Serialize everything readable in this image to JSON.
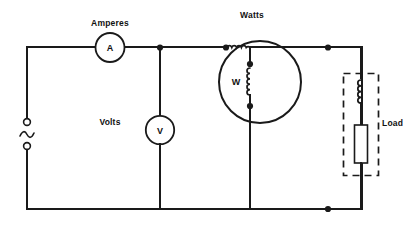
{
  "diagram": {
    "background_color": "#ffffff",
    "line_color": "#1a1a1a"
  },
  "labels": {
    "amperes": "Amperes",
    "watts": "Watts",
    "volts": "Volts",
    "load": "Load"
  },
  "meters": {
    "ammeter": {
      "symbol": "A",
      "label": "Amperes",
      "name": "ammeter"
    },
    "voltmeter": {
      "symbol": "V",
      "label": "Volts",
      "name": "voltmeter"
    },
    "wattmeter": {
      "symbol": "W",
      "label": "Watts",
      "name": "wattmeter"
    }
  },
  "components": {
    "ac_source": {
      "symbol": "~",
      "name": "ac-source"
    },
    "load": {
      "label": "Load",
      "elements": [
        "inductor",
        "resistor"
      ]
    }
  },
  "icons": {
    "sine_wave": "sine-wave-icon",
    "inductor_coil": "inductor-coil-icon",
    "resistor": "resistor-icon",
    "junction": "junction-dot-icon"
  }
}
